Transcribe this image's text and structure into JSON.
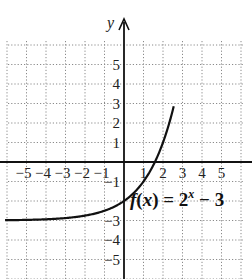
{
  "chart_data": {
    "type": "line",
    "title": "",
    "function_label": "f(x) = 2^x − 3",
    "function_parts": {
      "fx": "f",
      "open": "(",
      "var": "x",
      "close": ")",
      "eq": " = 2",
      "exp": "x",
      "tail": " − 3"
    },
    "xlabel": "",
    "ylabel": "y",
    "xlim": [
      -6,
      6
    ],
    "ylim": [
      -6,
      6
    ],
    "grid": true,
    "grid_style": "dotted",
    "x_ticks": [
      "−5",
      "−4",
      "−3",
      "−2",
      "−1",
      "1",
      "2",
      "3",
      "4",
      "5"
    ],
    "y_ticks": [
      "5",
      "4",
      "3",
      "2",
      "1",
      "−1",
      "−3",
      "−4",
      "−5"
    ],
    "series": [
      {
        "name": "f(x) = 2^x − 3",
        "x": [
          -6,
          -5,
          -4,
          -3,
          -2,
          -1,
          0,
          1,
          1.585,
          2,
          2.5,
          3
        ],
        "values": [
          -2.98,
          -2.97,
          -2.94,
          -2.88,
          -2.75,
          -2.5,
          -2,
          -1,
          0,
          1,
          2.66,
          5
        ]
      }
    ],
    "asymptote": {
      "y": -3
    }
  },
  "colors": {
    "curve": "#111111",
    "axis": "#111111",
    "grid": "#8a8a8a"
  }
}
